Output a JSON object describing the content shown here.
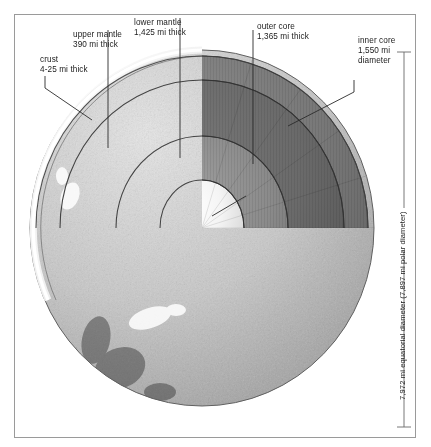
{
  "diagram": {
    "frame_color": "#9a9a9a",
    "text_color": "#1b1b1b",
    "callouts": [
      {
        "name": "crust",
        "lines": [
          "crust",
          "4-25 mi thick"
        ]
      },
      {
        "name": "upper-mantle",
        "lines": [
          "upper mantle",
          "390 mi thick"
        ]
      },
      {
        "name": "lower-mantle",
        "lines": [
          "lower mantle",
          "1,425 mi thick"
        ]
      },
      {
        "name": "outer-core",
        "lines": [
          "outer core",
          "1,365 mi thick"
        ]
      },
      {
        "name": "inner-core",
        "lines": [
          "inner core",
          "1,550 mi",
          "diameter"
        ]
      }
    ],
    "dimension_labels": [
      {
        "name": "equatorial-diameter",
        "text": "7,972 mi equatorial diameter (7,897 mi polar diameter)"
      }
    ]
  }
}
